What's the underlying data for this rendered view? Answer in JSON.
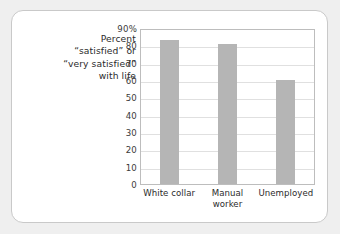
{
  "caption": {
    "lines": [
      "Percent",
      "“satisfied” or",
      "“very satisfied”",
      "with life"
    ]
  },
  "colors": {
    "bar": "#b5b5b5",
    "grid": "#e0e0e0",
    "plot_frame": "#bdbdbd",
    "card_background": "#ffffff",
    "card_border": "#c9c9c9",
    "page_background": "#efefef",
    "text": "#2b2b2b"
  },
  "chart_data": {
    "type": "bar",
    "title": "",
    "subtitle": "",
    "xlabel": "",
    "ylabel": "Percent “satisfied” or “very satisfied” with life",
    "categories": [
      "White collar",
      "Manual worker",
      "Unemployed"
    ],
    "category_lines": [
      [
        "White collar"
      ],
      [
        "Manual",
        "worker"
      ],
      [
        "Unemployed"
      ]
    ],
    "values": [
      83,
      80.5,
      60
    ],
    "ylim": [
      0,
      90
    ],
    "yticks": [
      0,
      10,
      20,
      30,
      40,
      50,
      60,
      70,
      80,
      90
    ],
    "ytick_labels": [
      "0",
      "10",
      "20",
      "30",
      "40",
      "50",
      "60",
      "70",
      "80",
      "90%"
    ],
    "grid": true,
    "grid_axis": "y",
    "legend": false,
    "legend_position": "none"
  }
}
